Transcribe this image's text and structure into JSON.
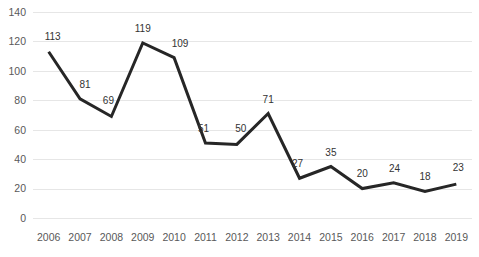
{
  "chart_data": {
    "type": "line",
    "title": "",
    "subtitle": "",
    "xlabel": "",
    "ylabel": "",
    "categories": [
      "2006",
      "2007",
      "2008",
      "2009",
      "2010",
      "2011",
      "2012",
      "2013",
      "2014",
      "2015",
      "2016",
      "2017",
      "2018",
      "2019"
    ],
    "values": [
      113,
      81,
      69,
      119,
      109,
      51,
      50,
      71,
      27,
      35,
      20,
      24,
      18,
      23
    ],
    "series": [
      {
        "name": "",
        "values": [
          113,
          81,
          69,
          119,
          109,
          51,
          50,
          71,
          27,
          35,
          20,
          24,
          18,
          23
        ]
      }
    ],
    "data_labels": [
      "113",
      "81",
      "69",
      "119",
      "109",
      "51",
      "50",
      "71",
      "27",
      "35",
      "20",
      "24",
      "18",
      "23"
    ],
    "ylim": [
      0,
      140
    ],
    "ytick_step": 20,
    "ytick_labels": [
      "140",
      "120",
      "100",
      "80",
      "60",
      "40",
      "20",
      "0"
    ],
    "ytick_values": [
      140,
      120,
      100,
      80,
      60,
      40,
      20,
      0
    ],
    "grid": "horizontal",
    "legend": "none",
    "markers": "none",
    "line_color": "#262626",
    "gridline_color": "#e6e6e6",
    "background_color": "#ffffff",
    "tick_label_color": "#595959",
    "data_label_color": "#333333"
  }
}
